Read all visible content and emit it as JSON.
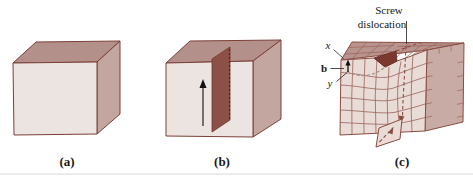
{
  "panels": {
    "a": {
      "caption": "(a)"
    },
    "b": {
      "caption": "(b)"
    },
    "c": {
      "caption": "(c)",
      "annotation": {
        "line1": "Screw",
        "line2": "dislocation"
      },
      "labels": {
        "x": "x",
        "b": "b",
        "y": "y"
      }
    }
  },
  "colors": {
    "face_front": "#ece4e0",
    "face_top": "#b3908a",
    "face_side": "#c4a6a1",
    "face_front_c": "#e9dcd7",
    "face_top_c": "#b7948e",
    "face_side_c": "#c9aba6",
    "cut_plane": "#8d5046",
    "step_wedge": "#7c382f",
    "flap": "#eadbd6",
    "outline": "#7b4038",
    "grid_line": "#9c6159",
    "dashed_line": "#8a4c42",
    "text": "#171717"
  }
}
